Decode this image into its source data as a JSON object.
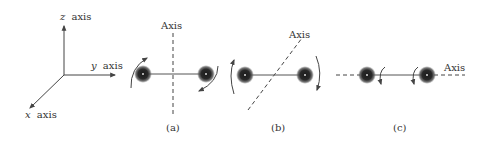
{
  "figure": {
    "coordinate_axes": {
      "z_label_var": "z",
      "y_label_var": "y",
      "x_label_var": "x",
      "axis_word": "axis"
    },
    "panels": [
      {
        "id": "a",
        "caption": "(a)",
        "axis_label": "Axis",
        "axis_orientation": "vertical, perpendicular to rod through midpoint"
      },
      {
        "id": "b",
        "caption": "(b)",
        "axis_label": "Axis",
        "axis_orientation": "diagonal through rod midpoint"
      },
      {
        "id": "c",
        "caption": "(c)",
        "axis_label": "Axis",
        "axis_orientation": "along the rod"
      }
    ],
    "colors": {
      "line": "#444444",
      "mass": "#2a2a2a",
      "text": "#333333"
    }
  }
}
